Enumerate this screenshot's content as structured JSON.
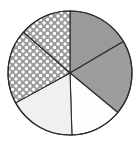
{
  "chart_data": {
    "type": "pie",
    "title": "",
    "subtitle": "",
    "xlabel": "",
    "ylabel": "",
    "legend": "none",
    "grid": false,
    "labels": [
      "Sector 1",
      "Sector 2",
      "Sector 3",
      "Sector 4",
      "Sector 5",
      "Sector 6"
    ],
    "values": [
      16.5,
      19.5,
      13.5,
      17.5,
      19.5,
      13.5
    ],
    "units": "percent",
    "start_angle_deg": -90,
    "direction": "clockwise",
    "center": {
      "x": 70,
      "y": 73
    },
    "radius": 62,
    "slices": [
      {
        "name": "Sector 1",
        "fill_style": "solid",
        "fill_color": "#9a9a9a",
        "start_deg": -90,
        "end_deg": -30.6,
        "value": 16.5
      },
      {
        "name": "Sector 2",
        "fill_style": "solid",
        "fill_color": "#9d9d9d",
        "start_deg": -30.6,
        "end_deg": 39.6,
        "value": 19.5
      },
      {
        "name": "Sector 3",
        "fill_style": "solid",
        "fill_color": "#fdfdfd",
        "start_deg": 39.6,
        "end_deg": 88.2,
        "value": 13.5
      },
      {
        "name": "Sector 4",
        "fill_style": "solid",
        "fill_color": "#f0f0f0",
        "start_deg": 88.2,
        "end_deg": 151.2,
        "value": 17.5
      },
      {
        "name": "Sector 5",
        "fill_style": "dotted",
        "fill_color": "#9b9b9b",
        "dot_color": "#ffffff",
        "start_deg": 151.2,
        "end_deg": 221.4,
        "value": 19.5
      },
      {
        "name": "Sector 6",
        "fill_style": "dotted",
        "fill_color": "#9b9b9b",
        "dot_color": "#ffffff",
        "start_deg": 221.4,
        "end_deg": 270.0,
        "value": 13.5
      }
    ],
    "outline_color": "#2b2b2b",
    "background_color": "#ffffff"
  }
}
